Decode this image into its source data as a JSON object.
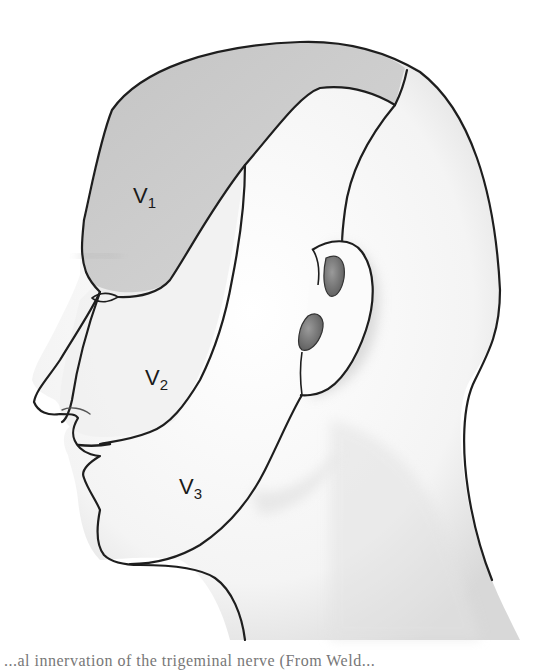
{
  "figure": {
    "regions": [
      {
        "id": "V1",
        "label_main": "V",
        "label_sub": "1",
        "name": "Ophthalmic division",
        "fill": "#cbcbcb"
      },
      {
        "id": "V2",
        "label_main": "V",
        "label_sub": "2",
        "name": "Maxillary division",
        "fill": "#f2f2f2"
      },
      {
        "id": "V3",
        "label_main": "V",
        "label_sub": "3",
        "name": "Mandibular division",
        "fill": "#f6f6f6"
      }
    ],
    "colors": {
      "outline": "#1e1e1e",
      "skin_light": "#f7f7f7",
      "skin_shadow": "#d9d9d9",
      "ear_shadow": "#8a8a8a",
      "background": "#ffffff"
    }
  },
  "caption": {
    "text": "...al innervation of the trigeminal nerve (From Weld..."
  }
}
